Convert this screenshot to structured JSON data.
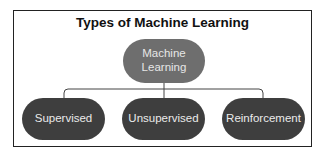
{
  "diagram": {
    "title": "Types of Machine Learning",
    "root": {
      "label_line1": "Machine",
      "label_line2": "Learning"
    },
    "children": [
      {
        "label": "Supervised"
      },
      {
        "label": "Unsupervised"
      },
      {
        "label": "Reinforcement"
      }
    ],
    "colors": {
      "root_fill": "#6e6e6e",
      "child_fill": "#3e3e3e",
      "text": "#eaeaea",
      "frame": "#222222",
      "connector": "#444444"
    }
  }
}
